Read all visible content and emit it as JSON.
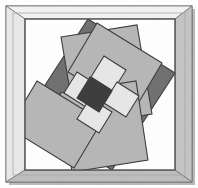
{
  "artwork": {
    "title": "Framed Abstract Geometric Composition",
    "medium": "flat-shaded vector illustration",
    "canvas": {
      "width": 198,
      "height": 188
    },
    "frame": {
      "label": "picture-frame",
      "outer_rect": {
        "x": 6,
        "y": 6,
        "width": 186,
        "height": 176
      },
      "inner_rect": {
        "x": 25,
        "y": 19,
        "width": 150,
        "height": 151
      },
      "outline_color": "#6a6a6a",
      "face_color": "#dcdcdc",
      "bevel_top_color": "#f2f2f2",
      "bevel_left_color": "#e9e9e9",
      "bevel_right_color": "#c4c4c4",
      "bevel_bottom_color": "#bdbdbd",
      "mat_color": "#d5d5d5",
      "shadow_color": "#9a9a9a"
    },
    "palette": {
      "background_dark_gray": "#6f6f6f",
      "mid_light_gray": "#b6b6b6",
      "panel_gray": "#b0b0b0",
      "near_white": "#e7e7e7",
      "center_dark": "#3b3b3b",
      "stroke": "#3a3a3a",
      "canvas_white": "#ffffff"
    },
    "rotation_degrees": -32,
    "composition_notes": "A square canvas rotated about 32 degrees counter-clockwise sits inside the frame. Four large light-gray rectangles pinwheel around the center leaving dark-gray triangular corners exposed. A plus/cross of four near-white squares surrounds a single dark square at the exact center.",
    "shapes": [
      {
        "name": "rotated-canvas-base",
        "role": "dark gray diamond field filling the mat opening",
        "fill": "#6f6f6f",
        "points": "88,19 175,73 112,170 25,116"
      },
      {
        "name": "pinwheel-rect-top",
        "role": "large light rectangle, upper portion",
        "fill": "#b6b6b6",
        "points": "61,37 137,25 152,114 76,126"
      },
      {
        "name": "pinwheel-rect-right",
        "role": "large light rectangle, right portion",
        "fill": "#b6b6b6",
        "points": "97,23 162,63 133,112 68,72"
      },
      {
        "name": "pinwheel-rect-bottom",
        "role": "large light rectangle, lower portion",
        "fill": "#b6b6b6",
        "points": "60,93 136,81 148,160 72,172"
      },
      {
        "name": "pinwheel-rect-left",
        "role": "large light rectangle, left portion",
        "fill": "#b6b6b6",
        "points": "37,81 102,121 74,168 9,128"
      },
      {
        "name": "center-square-north",
        "role": "near-white square above center",
        "fill": "#e7e7e7",
        "points": "104,56 126,70 113,91 91,77"
      },
      {
        "name": "center-square-west",
        "role": "near-white square left of center",
        "fill": "#e7e7e7",
        "points": "77,72 99,86 86,107 64,93"
      },
      {
        "name": "center-square-east",
        "role": "near-white square right of center",
        "fill": "#e7e7e7",
        "points": "117,82 139,96 126,117 104,103"
      },
      {
        "name": "center-square-south",
        "role": "near-white square below center",
        "fill": "#e7e7e7",
        "points": "90,98 112,112 99,133 77,119"
      },
      {
        "name": "center-square-dark",
        "role": "dark square at the exact center of the cross",
        "fill": "#3b3b3b",
        "points": "90,77 112,91 99,112 77,98"
      }
    ]
  }
}
